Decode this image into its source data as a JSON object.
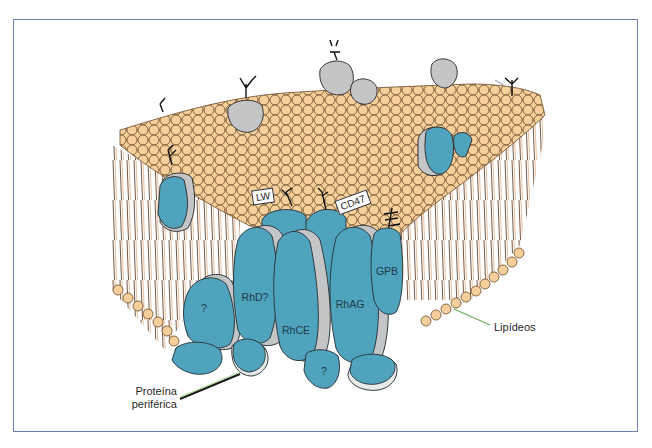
{
  "figure": {
    "colors": {
      "frame_border": "#6f7fb0",
      "lipid_head": "#f6cf9a",
      "lipid_outline": "#6b4a2a",
      "protein": "#4fa3bd",
      "protein_shadow": "#c4c6c8",
      "glyco_protein_gray": "#c3c5c7",
      "label_line": "#6fae5a"
    },
    "protein_labels": {
      "rhd": "RhD?",
      "rhce": "RhCE",
      "rhag": "RhAG",
      "gpb": "GPB",
      "unknown_left": "?",
      "unknown_bottom": "?"
    },
    "surface_tags": {
      "lw": "LW",
      "cd47": "CD47"
    },
    "callouts": {
      "lipids": "Lipídeos",
      "peripheral_protein_line1": "Proteína",
      "peripheral_protein_line2": "periférica"
    }
  }
}
